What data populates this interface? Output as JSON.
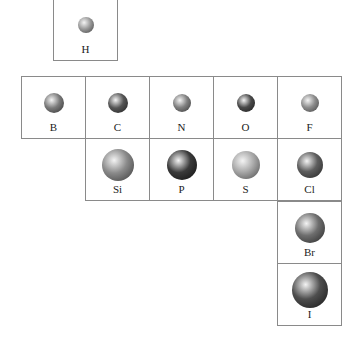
{
  "elements": [
    {
      "symbol": "H",
      "row": 0,
      "col": 1,
      "size": 16,
      "tone": "#9a9a9a",
      "dark": "#3e3e3e"
    },
    {
      "symbol": "B",
      "row": 1,
      "col": 0,
      "size": 20,
      "tone": "#7a7a7a",
      "dark": "#2e2e2e"
    },
    {
      "symbol": "C",
      "row": 1,
      "col": 1,
      "size": 20,
      "tone": "#555555",
      "dark": "#1e1e1e"
    },
    {
      "symbol": "N",
      "row": 1,
      "col": 2,
      "size": 18,
      "tone": "#808080",
      "dark": "#333333"
    },
    {
      "symbol": "O",
      "row": 1,
      "col": 3,
      "size": 18,
      "tone": "#4a4a4a",
      "dark": "#181818"
    },
    {
      "symbol": "F",
      "row": 1,
      "col": 4,
      "size": 18,
      "tone": "#8c8c8c",
      "dark": "#404040"
    },
    {
      "symbol": "Si",
      "row": 2,
      "col": 1,
      "size": 32,
      "tone": "#8a8a8a",
      "dark": "#383838"
    },
    {
      "symbol": "P",
      "row": 2,
      "col": 2,
      "size": 30,
      "tone": "#3a3a3a",
      "dark": "#0e0e0e"
    },
    {
      "symbol": "S",
      "row": 2,
      "col": 3,
      "size": 28,
      "tone": "#a8a8a8",
      "dark": "#4a4a4a"
    },
    {
      "symbol": "Cl",
      "row": 2,
      "col": 4,
      "size": 26,
      "tone": "#5e5e5e",
      "dark": "#222222"
    },
    {
      "symbol": "Br",
      "row": 3,
      "col": 4,
      "size": 30,
      "tone": "#6e6e6e",
      "dark": "#262626"
    },
    {
      "symbol": "I",
      "row": 4,
      "col": 4,
      "size": 36,
      "tone": "#4e4e4e",
      "dark": "#141414"
    }
  ]
}
